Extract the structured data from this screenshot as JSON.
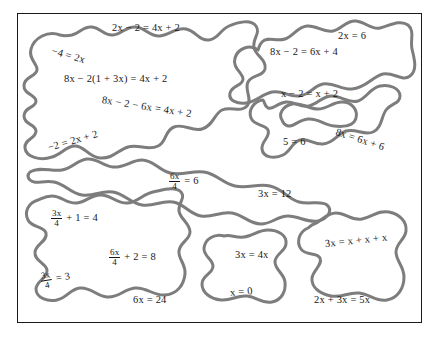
{
  "diagram": {
    "type": "blob-grouping-diagram",
    "outline_color": "#7d7d7d",
    "frame_color": "#1a1a1a",
    "text_color": "#171717",
    "background_color": "#ffffff"
  },
  "groups": [
    {
      "id": "group-top-left",
      "name": "group-top-left",
      "equations": [
        "eq_2x_minus_2",
        "eq_neg4_eq_2x",
        "eq_8x_minus_2_paren",
        "eq_8x_minus_2_minus_6x",
        "eq_neg2_eq_2x_plus_2"
      ]
    },
    {
      "id": "group-top-right",
      "name": "group-top-right",
      "equations": [
        "eq_2x_eq_6",
        "eq_8x_minus_2_eq_6x_plus_4",
        "eq_x_minus_2_eq_x_plus_2",
        "eq_5_eq_6",
        "eq_8x_eq_6x_plus_6"
      ]
    },
    {
      "id": "group-middle-band",
      "name": "group-middle-band",
      "equations": [
        "eq_6x_over_4_eq_6",
        "eq_3x_eq_12"
      ]
    },
    {
      "id": "group-bottom-left",
      "name": "group-bottom-left",
      "equations": [
        "eq_3x_over_4_plus_1",
        "eq_6x_over_4_plus_2",
        "eq_3x_over_4_eq_3",
        "eq_6x_eq_24"
      ]
    },
    {
      "id": "group-bottom-middle",
      "name": "group-bottom-middle",
      "equations": [
        "eq_3x_eq_4x",
        "eq_x_eq_0"
      ]
    },
    {
      "id": "group-bottom-right",
      "name": "group-bottom-right",
      "equations": [
        "eq_3x_eq_x_x_x",
        "eq_2x_plus_3x_eq_5x"
      ]
    }
  ],
  "equations": {
    "eq_2x_minus_2": "2x − 2 = 4x + 2",
    "eq_neg4_eq_2x": "−4 = 2x",
    "eq_8x_minus_2_paren": "8x − 2(1 + 3x) = 4x + 2",
    "eq_8x_minus_2_minus_6x": "8x − 2 − 6x = 4x + 2",
    "eq_neg2_eq_2x_plus_2": "−2 = 2x + 2",
    "eq_2x_eq_6": "2x = 6",
    "eq_8x_minus_2_eq_6x_plus_4": "8x − 2 = 6x + 4",
    "eq_x_minus_2_eq_x_plus_2": "x − 2 = x + 2",
    "eq_5_eq_6": "5 = 6",
    "eq_8x_eq_6x_plus_6": "8x = 6x + 6",
    "eq_6x_over_4_eq_6": {
      "num": "6x",
      "den": "4",
      "rest": "= 6"
    },
    "eq_3x_eq_12": "3x = 12",
    "eq_3x_over_4_plus_1": {
      "num": "3x",
      "den": "4",
      "rest": "+ 1 = 4"
    },
    "eq_6x_over_4_plus_2": {
      "num": "6x",
      "den": "4",
      "rest": "+ 2 = 8"
    },
    "eq_3x_over_4_eq_3": {
      "num": "3x",
      "den": "4",
      "rest": "= 3"
    },
    "eq_6x_eq_24": "6x = 24",
    "eq_3x_eq_4x": "3x = 4x",
    "eq_x_eq_0": "x = 0",
    "eq_3x_eq_x_x_x": "3x = x + x + x",
    "eq_2x_plus_3x_eq_5x": "2x + 3x = 5x"
  },
  "fraction_parts": {
    "six_x": "6x",
    "three_x": "3x",
    "four": "4",
    "eq6": "= 6",
    "plus1eq4": "+ 1 = 4",
    "plus2eq8": "+ 2 = 8",
    "eq3": "= 3"
  }
}
